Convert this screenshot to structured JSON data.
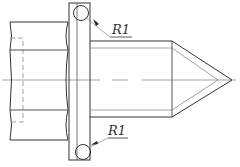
{
  "drawing": {
    "title": "Bolt with flange and conical tip - technical drawing",
    "colors": {
      "line": "#333333",
      "thin_line": "#8a8a8a",
      "background": "#ffffff"
    },
    "annotations": [
      {
        "id": "radius-top",
        "text": "R1"
      },
      {
        "id": "radius-bottom",
        "text": "R1"
      }
    ]
  }
}
